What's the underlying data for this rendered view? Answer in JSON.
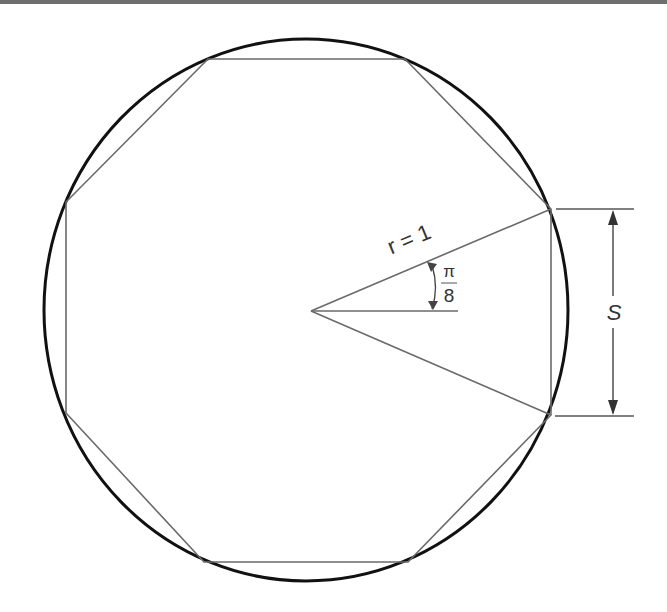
{
  "diagram": {
    "labels": {
      "radius": "r = 1",
      "angle_numerator": "π",
      "angle_denominator": "8",
      "side": "S"
    },
    "colors": {
      "circle": "#111111",
      "polygon": "#6a6a6a",
      "dimension": "#444444",
      "top_border": "#6e6e6e",
      "background": "#ffffff"
    },
    "shapes": {
      "circle": "unit circle",
      "polygon": "regular octagon",
      "sides": 8
    }
  }
}
